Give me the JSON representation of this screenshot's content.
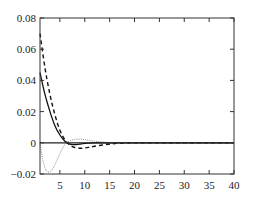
{
  "chart_data": {
    "type": "line",
    "title": "",
    "xlabel": "",
    "ylabel": "",
    "xlim": [
      1,
      40
    ],
    "ylim": [
      -0.02,
      0.08
    ],
    "grid": false,
    "legend": "none",
    "xticks": [
      5,
      10,
      15,
      20,
      25,
      30,
      35,
      40
    ],
    "xtick_labels": [
      "5",
      "10",
      "15",
      "20",
      "25",
      "30",
      "35",
      "40"
    ],
    "yticks": [
      -0.02,
      0,
      0.02,
      0.04,
      0.06,
      0.08
    ],
    "ytick_labels": [
      "-0.02",
      "0",
      "0.02",
      "0.04",
      "0.06",
      "0.08"
    ],
    "series": [
      {
        "name": "solid",
        "style": "solid",
        "color": "#111111",
        "x": [
          1,
          2,
          3,
          4,
          5,
          6,
          7,
          8,
          9,
          10,
          12,
          14,
          16,
          20,
          25,
          30,
          35,
          40
        ],
        "y": [
          0.045,
          0.031,
          0.02,
          0.011,
          0.005,
          0.001,
          -0.0008,
          -0.0012,
          -0.0008,
          -0.0004,
          -0.0001,
          0,
          0,
          0,
          0,
          0,
          0,
          0
        ]
      },
      {
        "name": "dashed",
        "style": "dashed",
        "color": "#111111",
        "x": [
          1,
          2,
          3,
          4,
          5,
          6,
          7,
          8,
          9,
          10,
          11,
          12,
          14,
          16,
          18,
          20,
          25,
          30,
          35,
          40
        ],
        "y": [
          0.07,
          0.048,
          0.031,
          0.018,
          0.008,
          0.002,
          -0.0015,
          -0.003,
          -0.0035,
          -0.0033,
          -0.0028,
          -0.0022,
          -0.0012,
          -0.0005,
          -0.0002,
          0,
          0,
          0,
          0,
          0
        ]
      },
      {
        "name": "dotted",
        "style": "dotted",
        "color": "#888888",
        "x": [
          1,
          1.5,
          2,
          2.5,
          3,
          3.5,
          4,
          5,
          6,
          7,
          8,
          9,
          10,
          12,
          14,
          16,
          18,
          20,
          25,
          30,
          35,
          40
        ],
        "y": [
          0,
          -0.01,
          -0.016,
          -0.0185,
          -0.0185,
          -0.017,
          -0.014,
          -0.007,
          -0.001,
          0.0012,
          0.0022,
          0.0024,
          0.002,
          0.001,
          0.0004,
          0.0001,
          0,
          0,
          0,
          0,
          0,
          0
        ]
      }
    ],
    "zero_line": true
  }
}
